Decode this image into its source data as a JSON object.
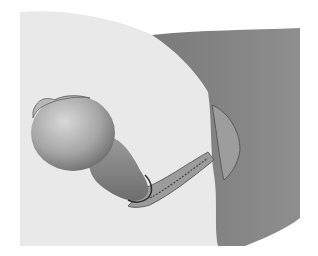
{
  "image": {
    "kind": "anatomical-illustration",
    "description": "Grayscale medical illustration of a rounded pedunculated mass on a stalk extending from a tissue wall",
    "colors": {
      "background": "#ffffff",
      "pale_tissue": "#e9e9e9",
      "wall_tissue": "#8a8a8a",
      "wall_dark": "#6f6f6f",
      "mass_light": "#cfcfcf",
      "mass_mid": "#a8a8a8",
      "mass_dark": "#6a6a6a",
      "outline": "#3a3a3a"
    }
  }
}
